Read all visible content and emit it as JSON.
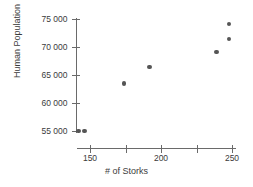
{
  "chart_data": {
    "type": "scatter",
    "title": "",
    "xlabel": "# of Storks",
    "ylabel": "Human Population",
    "xlim": [
      132,
      256
    ],
    "ylim": [
      53600,
      76000
    ],
    "grid": false,
    "legend": null,
    "x_ticks": [
      150,
      200,
      250
    ],
    "x_tick_labels": [
      "150",
      "200",
      "250"
    ],
    "x_minor_ticks": [
      175,
      225
    ],
    "y_ticks": [
      55000,
      60000,
      65000,
      70000,
      75000
    ],
    "y_tick_labels": [
      "55 000",
      "60 000",
      "65 000",
      "70 000",
      "75 000"
    ],
    "marker_color": "#555555",
    "axis_color": "#6a6a6a",
    "points": [
      {
        "x": 142,
        "y": 55000
      },
      {
        "x": 146,
        "y": 55000
      },
      {
        "x": 174,
        "y": 63500
      },
      {
        "x": 192,
        "y": 66400
      },
      {
        "x": 239,
        "y": 69100
      },
      {
        "x": 248,
        "y": 71400
      },
      {
        "x": 248,
        "y": 74100
      }
    ]
  }
}
